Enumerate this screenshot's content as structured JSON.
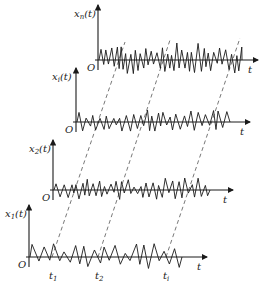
{
  "diagram": {
    "panels": [
      {
        "id": "n",
        "ylabel": "x_n(t)",
        "ylabel_main": "x",
        "ylabel_sub": "n",
        "ylabel_tail": "(t)",
        "origin": "O",
        "xlabel": "t",
        "axis_x": 98,
        "axis_y": 60,
        "top": 5,
        "end": 258,
        "seed": 7,
        "amp": 16,
        "start": 101,
        "stop": 242,
        "step": 2.6
      },
      {
        "id": "i",
        "ylabel": "x_i(t)",
        "ylabel_main": "x",
        "ylabel_sub": "i",
        "ylabel_tail": "(t)",
        "origin": "O",
        "xlabel": "t",
        "axis_x": 76,
        "axis_y": 122,
        "top": 68,
        "end": 250,
        "seed": 13,
        "amp": 11,
        "start": 79,
        "stop": 230,
        "step": 3.4
      },
      {
        "id": "2",
        "ylabel": "x_2(t)",
        "ylabel_main": "x",
        "ylabel_sub": "2",
        "ylabel_tail": "(t)",
        "origin": "O",
        "xlabel": "t",
        "axis_x": 53,
        "axis_y": 190,
        "top": 140,
        "end": 233,
        "seed": 29,
        "amp": 11,
        "start": 56,
        "stop": 210,
        "step": 3.0
      },
      {
        "id": "1",
        "ylabel": "x_1(t)",
        "ylabel_main": "x",
        "ylabel_sub": "1",
        "ylabel_tail": "(t)",
        "origin": "O",
        "xlabel": "t",
        "axis_x": 29,
        "axis_y": 257,
        "top": 205,
        "end": 207,
        "seed": 41,
        "amp": 13,
        "start": 32,
        "stop": 182,
        "step": 5.0
      }
    ],
    "time_marks": [
      {
        "label": "t",
        "sub": "1",
        "x": 52
      },
      {
        "label": "t",
        "sub": "2",
        "x": 98
      },
      {
        "label": "t",
        "sub": "i",
        "x": 166
      }
    ],
    "dashed_lines": [
      {
        "from": [
          52,
          257
        ],
        "to": [
          125,
          42
        ]
      },
      {
        "from": [
          98,
          257
        ],
        "to": [
          170,
          40
        ]
      },
      {
        "from": [
          166,
          257
        ],
        "to": [
          240,
          38
        ]
      }
    ],
    "colors": {
      "line": "#1a1a1a",
      "dash": "#555555",
      "background": "#ffffff"
    }
  }
}
